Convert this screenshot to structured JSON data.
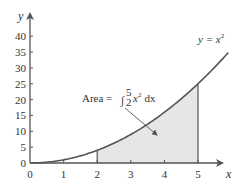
{
  "chart_data": {
    "type": "area",
    "title": "",
    "xlabel": "x",
    "ylabel": "y",
    "xlim": [
      0,
      5.9
    ],
    "ylim": [
      0,
      42
    ],
    "grid": false,
    "legend": null,
    "xticks": [
      0,
      1,
      2,
      3,
      4,
      5
    ],
    "yticks": [
      0,
      5,
      10,
      15,
      20,
      25,
      30,
      35,
      40
    ],
    "series": [
      {
        "name": "y = x^2",
        "label": "y = x",
        "label_exponent": "2",
        "function": "x^2",
        "x": [
          0,
          0.5,
          1,
          1.5,
          2,
          2.5,
          3,
          3.5,
          4,
          4.5,
          5,
          5.5,
          5.9
        ],
        "values": [
          0,
          0.25,
          1,
          2.25,
          4,
          6.25,
          9,
          12.25,
          16,
          20.25,
          25,
          30.25,
          34.81
        ]
      }
    ],
    "shaded_region": {
      "from": 2,
      "to": 5,
      "under": "y = x^2",
      "fill": "#e6e6e6"
    },
    "annotations": [
      {
        "text_prefix": "Area = ",
        "integral_upper": "5",
        "integral_lower": "2",
        "integrand": "x",
        "integrand_exponent": "2",
        "differential": " dx",
        "arrow_from": [
          3.3,
          18
        ],
        "arrow_to": [
          3.7,
          9.5
        ]
      }
    ],
    "colors": {
      "curve": "#555555",
      "axes": "#555555",
      "shade": "#e6e6e6",
      "text": "#333333"
    }
  },
  "axes": {
    "x_label": "x",
    "y_label": "y",
    "x_tick_labels": [
      "0",
      "1",
      "2",
      "3",
      "4",
      "5"
    ],
    "y_tick_labels": [
      "0",
      "5",
      "10",
      "15",
      "20",
      "25",
      "30",
      "35",
      "40"
    ]
  },
  "curve_label": {
    "base": "y = x",
    "exponent": "2"
  },
  "area_annotation": {
    "prefix": "Area =",
    "integral_sign": "∫",
    "upper": "5",
    "lower": "2",
    "integrand": "x",
    "exponent": "2",
    "differential": "dx"
  }
}
